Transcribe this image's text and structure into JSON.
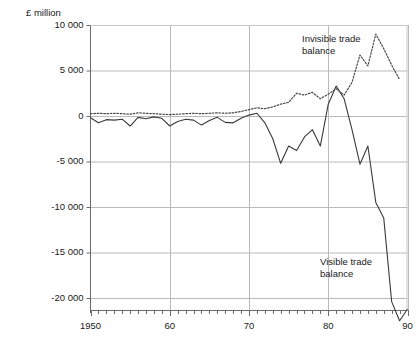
{
  "chart_data": {
    "type": "line",
    "title": "",
    "subtitle": "",
    "unit_label": "£ million",
    "xlabel": "",
    "ylabel": "£ million",
    "grid": true,
    "legend_position": "inline-annotations",
    "xlim": [
      1950,
      1990
    ],
    "ylim": [
      -22500,
      10000
    ],
    "yticks": [
      10000,
      5000,
      0,
      -5000,
      -10000,
      -15000,
      -20000
    ],
    "ytick_labels": [
      "10 000",
      "5 000",
      "0",
      "-5 000",
      "-10 000",
      "-15 000",
      "-20 000"
    ],
    "xticks": [
      1950,
      1960,
      1970,
      1980,
      1990
    ],
    "xtick_labels": [
      "1950",
      "60",
      "70",
      "80",
      "90"
    ],
    "x_minor_tick_interval": 1,
    "annotations": [
      {
        "name": "invisible-trade-balance-label",
        "lines": [
          "Invisible trade",
          "balance"
        ],
        "x_px": 302,
        "y_px": 33
      },
      {
        "name": "visible-trade-balance-label",
        "lines": [
          "Visible trade",
          "balance"
        ],
        "x_px": 320,
        "y_px": 256
      }
    ],
    "x": [
      1950,
      1951,
      1952,
      1953,
      1954,
      1955,
      1956,
      1957,
      1958,
      1959,
      1960,
      1961,
      1962,
      1963,
      1964,
      1965,
      1966,
      1967,
      1968,
      1969,
      1970,
      1971,
      1972,
      1973,
      1974,
      1975,
      1976,
      1977,
      1978,
      1979,
      1980,
      1981,
      1982,
      1983,
      1984,
      1985,
      1986,
      1987,
      1988,
      1989
    ],
    "series": [
      {
        "name": "Visible trade balance",
        "style": "solid",
        "color": "#3a3a3a",
        "values": [
          -200,
          -750,
          -400,
          -450,
          -350,
          -1100,
          -150,
          -300,
          -100,
          -250,
          -1100,
          -600,
          -350,
          -450,
          -1000,
          -500,
          -150,
          -700,
          -750,
          -250,
          100,
          300,
          -750,
          -2500,
          -5200,
          -3300,
          -3800,
          -2300,
          -1500,
          -3300,
          1300,
          3300,
          1900,
          -1500,
          -5300,
          -3300,
          -9500,
          -11200,
          -20400,
          -22500
        ]
      },
      {
        "name": "Invisible trade balance",
        "style": "dotted",
        "color": "#4a4a4a",
        "values": [
          250,
          300,
          250,
          300,
          250,
          200,
          350,
          300,
          250,
          200,
          150,
          200,
          250,
          300,
          250,
          300,
          350,
          300,
          350,
          500,
          700,
          900,
          800,
          1000,
          1300,
          1500,
          2500,
          2300,
          2600,
          1900,
          2400,
          3000,
          2300,
          3700,
          6700,
          5500,
          9000,
          7400,
          5600,
          4000
        ]
      }
    ]
  }
}
